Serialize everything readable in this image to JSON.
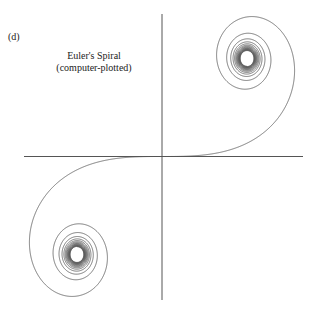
{
  "panel_label": "(d)",
  "title": {
    "line1": "Euler's Spiral",
    "line2": "(computer-plotted)"
  },
  "axes": {
    "origin_px": [
      162,
      156.5
    ],
    "horizontal": {
      "x1": 24,
      "x2": 303
    },
    "vertical": {
      "y1": 14,
      "y2": 300
    },
    "color": "#555555"
  },
  "spiral": {
    "name": "Euler spiral (clothoid)",
    "curve": "x(t)=∫cos(πs²/2)ds, y(t)=∫sin(πs²/2)ds",
    "t_range": [
      -8,
      8
    ],
    "limit_points": [
      [
        0.5,
        0.5
      ],
      [
        -0.5,
        -0.5
      ]
    ],
    "scale_px": [
      170,
      196
    ],
    "color": "#555555"
  }
}
